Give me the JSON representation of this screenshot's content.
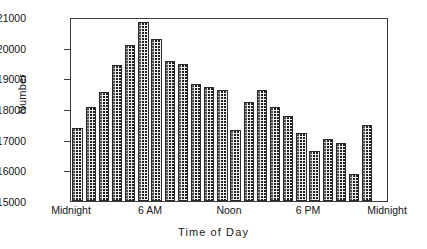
{
  "chart_data": {
    "type": "bar",
    "title": "",
    "xlabel": "Time of Day",
    "ylabel": "Number",
    "ylim": [
      15000,
      21000
    ],
    "ytick_values": [
      15000,
      16000,
      17000,
      18000,
      19000,
      20000,
      21000
    ],
    "ytick_labels": [
      "15000",
      "16000",
      "17000",
      "18000",
      "19000",
      "20000",
      "21000"
    ],
    "xtick_labels": [
      "Midnight",
      "6  AM",
      "Noon",
      "6  PM",
      "Midnight"
    ],
    "xtick_hours": [
      0,
      6,
      12,
      18,
      24
    ],
    "grid": false,
    "legend": null,
    "categories": [
      "0",
      "1",
      "2",
      "3",
      "4",
      "5",
      "6",
      "7",
      "8",
      "9",
      "10",
      "11",
      "12",
      "13",
      "14",
      "15",
      "16",
      "17",
      "18",
      "19",
      "20",
      "21",
      "22"
    ],
    "values": [
      17400,
      18100,
      18600,
      19500,
      20150,
      20900,
      20350,
      19600,
      19520,
      18850,
      18750,
      18670,
      17350,
      18250,
      18650,
      18100,
      17800,
      17250,
      16650,
      17050,
      16900,
      15900,
      17500
    ],
    "bar_style": {
      "fill": "#f2f2f2",
      "pattern": "dotted-stipple",
      "edge_color": "#2b2b2b"
    }
  },
  "axes": {
    "frame_color": "#3a3a3a"
  }
}
